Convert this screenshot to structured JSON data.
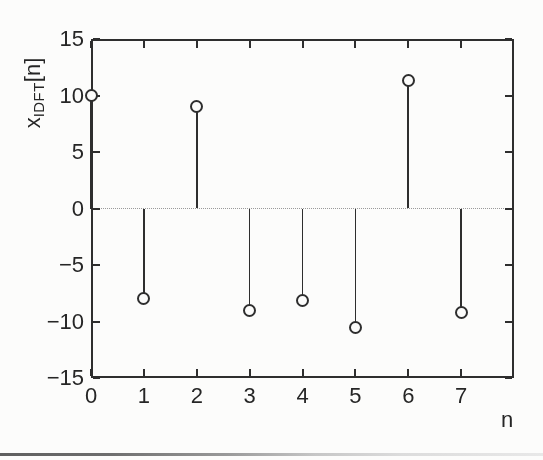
{
  "figure": {
    "ylabel": {
      "base": "x",
      "sub": "IDFT",
      "suffix": "[n]"
    },
    "xlabel": "n"
  },
  "chart_data": {
    "type": "stem",
    "title": "",
    "xlabel": "n",
    "ylabel": "x_IDFT[n]",
    "x": [
      0,
      1,
      2,
      3,
      4,
      5,
      6,
      7
    ],
    "values": [
      10,
      -8,
      9,
      -9,
      -8.1,
      -10.5,
      11.3,
      -9.2
    ],
    "xlim": [
      0,
      8
    ],
    "ylim": [
      -15,
      15
    ],
    "xticks": [
      0,
      1,
      2,
      3,
      4,
      5,
      6,
      7
    ],
    "yticks": [
      15,
      10,
      5,
      0,
      -5,
      -10,
      -15
    ],
    "zero_line": "dotted",
    "marker": "open-circle",
    "box": true,
    "grid": false,
    "legend": false,
    "ink_color": "#2e2e2e",
    "zero_line_color": "#9a9a9a",
    "background": "#fcfcfb"
  }
}
